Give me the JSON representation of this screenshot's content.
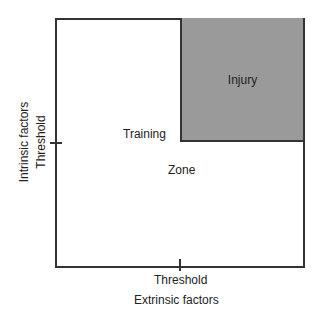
{
  "diagram": {
    "regions": {
      "injury": "Injury",
      "training": "Training",
      "zone": "Zone"
    },
    "x_axis": {
      "tick_label": "Threshold",
      "title": "Extrinsic factors"
    },
    "y_axis": {
      "tick_label": "Threshold",
      "title": "Intrinsic factors"
    },
    "colors": {
      "injury_fill": "#9a9a9a",
      "border": "#333333"
    }
  }
}
